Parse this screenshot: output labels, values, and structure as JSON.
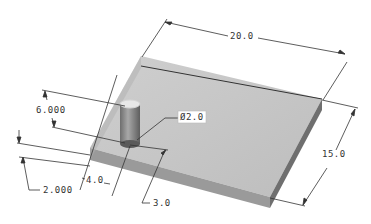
{
  "dimensions": {
    "plate_length": "20.0",
    "plate_width": "15.0",
    "pin_diameter": "Ø2.0",
    "pin_height": "6.000",
    "plate_thickness": "2.000",
    "pin_offset_x": "4.0",
    "pin_offset_y": "3.0"
  },
  "colors": {
    "plate_top": "#c8c8c8",
    "plate_front": "#9a9a9a",
    "plate_side": "#7a7a7a",
    "pin": "#8c8c8c",
    "dimension_line": "#333333",
    "background": "#ffffff"
  }
}
